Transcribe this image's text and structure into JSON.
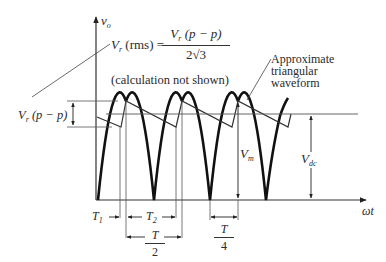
{
  "figure": {
    "axis": {
      "y_label": "v",
      "y_label_sub": "o",
      "x_label": "ωt"
    },
    "formula": {
      "lhs_var": "V",
      "lhs_sub": "r",
      "lhs_paren": "(rms) =",
      "numerator_var": "V",
      "numerator_sub": "r",
      "numerator_rest": "(p − p)",
      "denominator": "2√3"
    },
    "note": "(calculation not shown)",
    "annotation_triangular": [
      "Approximate",
      "triangular",
      "waveform"
    ],
    "labels": {
      "vr_pp_var": "V",
      "vr_pp_sub": "r",
      "vr_pp_rest": "(p − p)",
      "vm_var": "V",
      "vm_sub": "m",
      "vdc_var": "V",
      "vdc_sub": "dc",
      "t1_var": "T",
      "t1_sub": "1",
      "t2_var": "T",
      "t2_sub": "2",
      "half_period_num": "T",
      "half_period_den": "2",
      "quarter_period_num": "T",
      "quarter_period_den": "4"
    },
    "colors": {
      "ink": "#222222",
      "thin_line": "#555555",
      "background": "#ffffff"
    }
  }
}
